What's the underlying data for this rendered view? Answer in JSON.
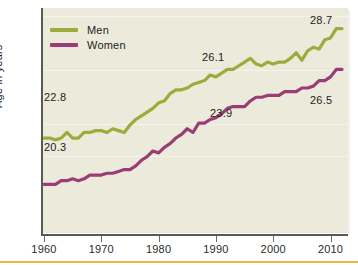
{
  "figure": {
    "y_axis_title": "Age in years",
    "accent_rule_color": "#e3a92a",
    "panel_background": "#eceadb"
  },
  "legend": {
    "position": "top-left-inside",
    "entries": [
      {
        "label": "Men",
        "color": "#9aad3c",
        "icon": "line-swatch"
      },
      {
        "label": "Women",
        "color": "#9b3d74",
        "icon": "line-swatch"
      }
    ]
  },
  "axis": {
    "x_ticks": [
      "1960",
      "1970",
      "1980",
      "1990",
      "2000",
      "2010"
    ],
    "x_tick_values": [
      1960,
      1970,
      1980,
      1990,
      2000,
      2010
    ]
  },
  "annotations": [
    {
      "name": "men-start-label",
      "text": "22.8",
      "series": "Men",
      "x": 1960,
      "y": 22.8
    },
    {
      "name": "men-mid-label",
      "text": "26.1",
      "series": "Men",
      "x": 1990,
      "y": 26.1
    },
    {
      "name": "men-end-label",
      "text": "28.7",
      "series": "Men",
      "x": 2012,
      "y": 28.7
    },
    {
      "name": "women-start-label",
      "text": "20.3",
      "series": "Women",
      "x": 1960,
      "y": 20.3
    },
    {
      "name": "women-mid-label",
      "text": "23.9",
      "series": "Women",
      "x": 1990,
      "y": 23.9
    },
    {
      "name": "women-end-label",
      "text": "26.5",
      "series": "Women",
      "x": 2012,
      "y": 26.5
    }
  ],
  "chart_data": {
    "type": "line",
    "title": "",
    "subtitle": "",
    "xlabel": "",
    "ylabel": "Age in years",
    "xlim": [
      1960,
      2012
    ],
    "ylim": [
      18.0,
      29.6
    ],
    "grid": true,
    "legend_position": "upper left",
    "x": [
      1960,
      1961,
      1962,
      1963,
      1964,
      1965,
      1966,
      1967,
      1968,
      1969,
      1970,
      1971,
      1972,
      1973,
      1974,
      1975,
      1976,
      1977,
      1978,
      1979,
      1980,
      1981,
      1982,
      1983,
      1984,
      1985,
      1986,
      1987,
      1988,
      1989,
      1990,
      1991,
      1992,
      1993,
      1994,
      1995,
      1996,
      1997,
      1998,
      1999,
      2000,
      2001,
      2002,
      2003,
      2004,
      2005,
      2006,
      2007,
      2008,
      2009,
      2010,
      2011,
      2012
    ],
    "series": [
      {
        "name": "Men",
        "color": "#9aad3c",
        "values": [
          22.8,
          22.8,
          22.7,
          22.8,
          23.1,
          22.8,
          22.8,
          23.1,
          23.1,
          23.2,
          23.2,
          23.1,
          23.3,
          23.2,
          23.1,
          23.5,
          23.8,
          24.0,
          24.2,
          24.4,
          24.7,
          24.8,
          25.2,
          25.4,
          25.4,
          25.5,
          25.7,
          25.8,
          25.9,
          26.2,
          26.1,
          26.3,
          26.5,
          26.5,
          26.7,
          26.9,
          27.1,
          26.8,
          26.7,
          26.9,
          26.8,
          26.9,
          26.9,
          27.1,
          27.4,
          27.0,
          27.5,
          27.7,
          27.6,
          28.1,
          28.2,
          28.7,
          28.7
        ]
      },
      {
        "name": "Women",
        "color": "#9b3d74",
        "values": [
          20.3,
          20.3,
          20.3,
          20.5,
          20.5,
          20.6,
          20.5,
          20.6,
          20.8,
          20.8,
          20.8,
          20.9,
          20.9,
          21.0,
          21.1,
          21.1,
          21.3,
          21.6,
          21.8,
          22.1,
          22.0,
          22.3,
          22.5,
          22.8,
          23.0,
          23.3,
          23.1,
          23.6,
          23.6,
          23.8,
          23.9,
          24.1,
          24.4,
          24.5,
          24.5,
          24.5,
          24.8,
          25.0,
          25.0,
          25.1,
          25.1,
          25.1,
          25.3,
          25.3,
          25.3,
          25.5,
          25.5,
          25.6,
          25.9,
          25.9,
          26.1,
          26.5,
          26.5
        ]
      }
    ]
  }
}
